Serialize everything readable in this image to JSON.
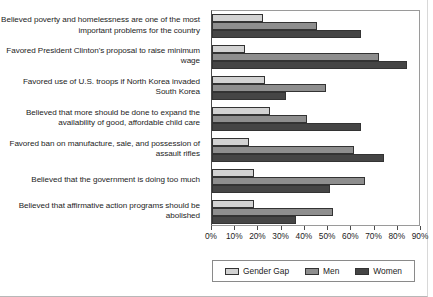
{
  "chart_data": {
    "type": "bar",
    "orientation": "horizontal",
    "title": "",
    "xlabel": "",
    "ylabel": "",
    "xlim": [
      0,
      90
    ],
    "xticks": [
      "0%",
      "10%",
      "20%",
      "30%",
      "40%",
      "50%",
      "60%",
      "70%",
      "80%",
      "90%"
    ],
    "grid": false,
    "legend_position": "bottom",
    "categories": [
      "Believed poverty and homelessness are one of the most important problems for the country",
      "Favored President Clinton's proposal to raise minimum wage",
      "Favored use of U.S. troops if North Korea invaded South Korea",
      "Believed that more should be done to expand the availability of good, affordable child care",
      "Favored ban on manufacture, sale, and possession of assault rifles",
      "Believed that the government is doing too much",
      "Believed that affirmative action programs should be abolished"
    ],
    "series": [
      {
        "name": "Gender Gap",
        "color": "#d2d2d2",
        "values": [
          22,
          14,
          23,
          25,
          16,
          18,
          18
        ]
      },
      {
        "name": "Men",
        "color": "#8e8e8e",
        "values": [
          45,
          72,
          49,
          41,
          61,
          66,
          52
        ]
      },
      {
        "name": "Women",
        "color": "#454545",
        "values": [
          64,
          84,
          32,
          64,
          74,
          51,
          36
        ]
      }
    ]
  },
  "legend": {
    "entries": [
      {
        "label": "Gender Gap",
        "color": "#d2d2d2"
      },
      {
        "label": "Men",
        "color": "#8e8e8e"
      },
      {
        "label": "Women",
        "color": "#454545"
      }
    ]
  }
}
